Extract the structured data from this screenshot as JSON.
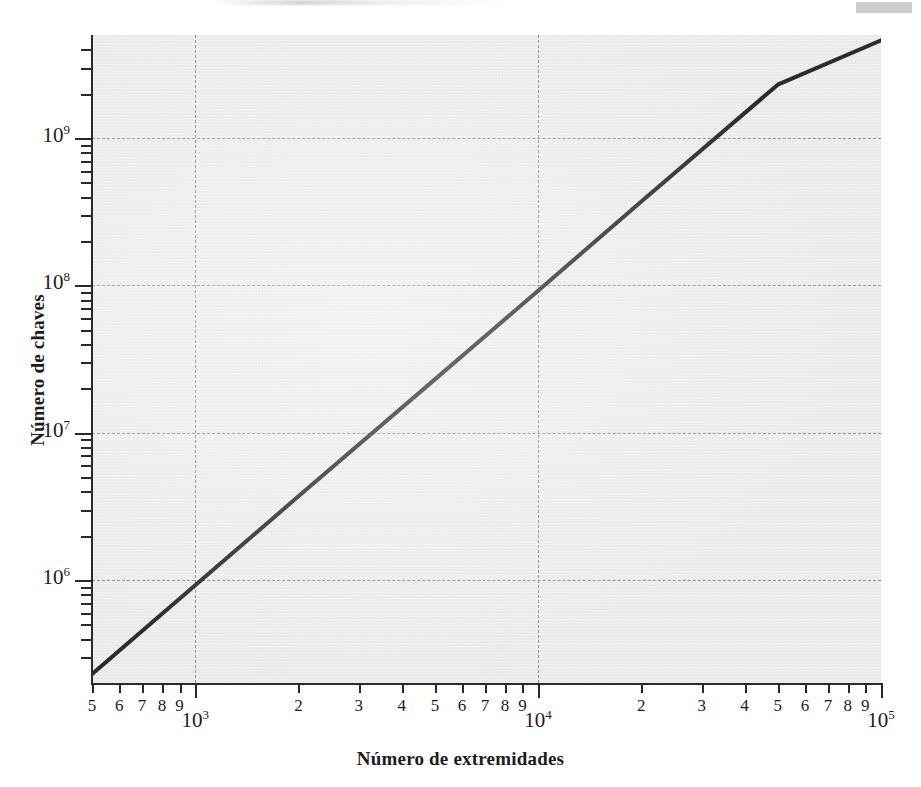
{
  "figure": {
    "background_color": "#ffffff",
    "plot_background_color": "#e9e9e9",
    "axis_color": "#2a2a2a",
    "grid_color": "#8e8e8e",
    "line_color": "#2b2b2b"
  },
  "chart_data": {
    "type": "line",
    "title": "",
    "subtitle": "",
    "xlabel": "Número de extremidades",
    "ylabel": "Número de chaves",
    "xscale": "log",
    "yscale": "log",
    "xlim": [
      500,
      100000
    ],
    "ylim": [
      200000,
      5000000000
    ],
    "grid": true,
    "legend": null,
    "annotations": [],
    "series": [
      {
        "name": "Número de chaves vs número de extremidades",
        "x": [
          500,
          1000,
          2000,
          5000,
          10000,
          20000,
          50000,
          100000
        ],
        "y": [
          230000,
          920000,
          3700000,
          23000000,
          92000000,
          370000000,
          2300000000,
          4600000000
        ],
        "note": "Straight line on log-log axes; slope ≈ 2 (power law, y ∝ x²) from lower-left to upper-right corner"
      }
    ],
    "x_major_ticks": [
      {
        "value": 1000,
        "label": "10",
        "exponent": "3"
      },
      {
        "value": 10000,
        "label": "10",
        "exponent": "4"
      },
      {
        "value": 100000,
        "label": "10",
        "exponent": "5"
      }
    ],
    "x_minor_ticks": [
      {
        "value": 500,
        "label": "5"
      },
      {
        "value": 600,
        "label": "6"
      },
      {
        "value": 700,
        "label": "7"
      },
      {
        "value": 800,
        "label": "8"
      },
      {
        "value": 900,
        "label": "9"
      },
      {
        "value": 2000,
        "label": "2"
      },
      {
        "value": 3000,
        "label": "3"
      },
      {
        "value": 4000,
        "label": "4"
      },
      {
        "value": 5000,
        "label": "5"
      },
      {
        "value": 6000,
        "label": "6"
      },
      {
        "value": 7000,
        "label": "7"
      },
      {
        "value": 8000,
        "label": "8"
      },
      {
        "value": 9000,
        "label": "9"
      },
      {
        "value": 20000,
        "label": "2"
      },
      {
        "value": 30000,
        "label": "3"
      },
      {
        "value": 40000,
        "label": "4"
      },
      {
        "value": 50000,
        "label": "5"
      },
      {
        "value": 60000,
        "label": "6"
      },
      {
        "value": 70000,
        "label": "7"
      },
      {
        "value": 80000,
        "label": "8"
      },
      {
        "value": 90000,
        "label": "9"
      }
    ],
    "y_major_ticks": [
      {
        "value": 1000000,
        "label": "10",
        "exponent": "6"
      },
      {
        "value": 10000000,
        "label": "10",
        "exponent": "7"
      },
      {
        "value": 100000000,
        "label": "10",
        "exponent": "8"
      },
      {
        "value": 1000000000,
        "label": "10",
        "exponent": "9"
      }
    ],
    "y_minor_tick_values": [
      300000,
      400000,
      500000,
      600000,
      700000,
      800000,
      900000,
      2000000,
      3000000,
      4000000,
      5000000,
      6000000,
      7000000,
      8000000,
      9000000,
      20000000,
      30000000,
      40000000,
      50000000,
      60000000,
      70000000,
      80000000,
      90000000,
      200000000,
      300000000,
      400000000,
      500000000,
      600000000,
      700000000,
      800000000,
      900000000,
      2000000000,
      3000000000,
      4000000000
    ],
    "gridline_x_values": [
      1000,
      10000
    ],
    "gridline_y_values": [
      1000000,
      10000000,
      100000000,
      1000000000
    ]
  }
}
